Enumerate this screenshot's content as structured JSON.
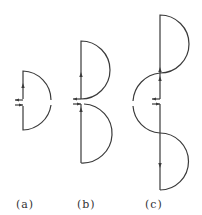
{
  "figure": {
    "type": "current-loop circuit diagrams",
    "panels": [
      {
        "id": "a",
        "label": "(a)",
        "description": "single half-circle loop with feed gap at centre"
      },
      {
        "id": "b",
        "label": "(b)",
        "description": "two stacked half-circle loops on the same side"
      },
      {
        "id": "c",
        "label": "(c)",
        "description": "three half-circle loops alternating sides (S-shape)"
      }
    ],
    "line_color": "#3a3a3a",
    "background": "#ffffff"
  }
}
